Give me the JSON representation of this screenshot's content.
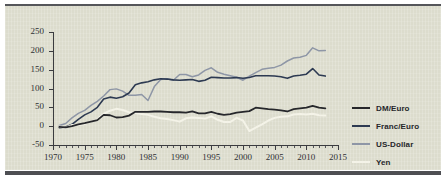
{
  "chart_data": {
    "type": "line",
    "title": "",
    "subtitle": "",
    "xlabel": "",
    "ylabel": "",
    "xlim": [
      1970,
      2015
    ],
    "ylim": [
      -50,
      250
    ],
    "grid": false,
    "legend_position": "right",
    "y_ticks": [
      250,
      200,
      150,
      100,
      50,
      0,
      -50
    ],
    "y_tick_labels": [
      "250",
      "200",
      "150",
      "100",
      "50",
      "0",
      "-50"
    ],
    "x_ticks": [
      1970,
      1975,
      1980,
      1985,
      1990,
      1995,
      2000,
      2005,
      2010,
      2015
    ],
    "x_tick_labels": [
      "1970",
      "1975",
      "1980",
      "1985",
      "1990",
      "1995",
      "2000",
      "2005",
      "2010",
      "2015"
    ],
    "x_minor_tick_step": 1,
    "x": [
      1971,
      1972,
      1973,
      1974,
      1975,
      1976,
      1977,
      1978,
      1979,
      1980,
      1981,
      1982,
      1983,
      1984,
      1985,
      1986,
      1987,
      1988,
      1989,
      1990,
      1991,
      1992,
      1993,
      1994,
      1995,
      1996,
      1997,
      1998,
      1999,
      2000,
      2001,
      2002,
      2003,
      2004,
      2005,
      2006,
      2007,
      2008,
      2009,
      2010,
      2011,
      2012,
      2013
    ],
    "series": [
      {
        "name": "DM/Euro",
        "color": "#26272b",
        "values": [
          -2,
          -3,
          0,
          5,
          8,
          12,
          16,
          30,
          29,
          23,
          24,
          28,
          38,
          38,
          38,
          39,
          39,
          38,
          37,
          37,
          36,
          39,
          34,
          34,
          38,
          33,
          30,
          32,
          36,
          38,
          40,
          49,
          47,
          45,
          44,
          42,
          39,
          45,
          47,
          49,
          54,
          49,
          47
        ]
      },
      {
        "name": "Franc/Euro",
        "color": "#2d3a52",
        "values": [
          -4,
          -2,
          5,
          18,
          30,
          38,
          50,
          72,
          77,
          74,
          78,
          88,
          110,
          115,
          118,
          123,
          126,
          125,
          123,
          122,
          123,
          124,
          119,
          122,
          130,
          129,
          128,
          128,
          129,
          127,
          129,
          134,
          134,
          134,
          133,
          131,
          127,
          133,
          135,
          138,
          153,
          136,
          133
        ]
      },
      {
        "name": "US-Dollar",
        "color": "#8e96a6",
        "values": [
          2,
          7,
          22,
          34,
          42,
          55,
          66,
          80,
          97,
          99,
          93,
          82,
          82,
          84,
          68,
          105,
          124,
          126,
          122,
          137,
          137,
          131,
          136,
          148,
          155,
          143,
          138,
          134,
          130,
          122,
          133,
          142,
          151,
          154,
          156,
          162,
          173,
          181,
          183,
          188,
          208,
          200,
          201
        ]
      },
      {
        "name": "Yen",
        "color": "#f4f3e8",
        "values": [
          -1,
          -4,
          3,
          3,
          6,
          12,
          18,
          33,
          41,
          46,
          43,
          37,
          35,
          32,
          30,
          25,
          21,
          19,
          16,
          12,
          21,
          23,
          22,
          20,
          26,
          17,
          11,
          11,
          22,
          15,
          -13,
          -4,
          5,
          15,
          22,
          25,
          26,
          31,
          32,
          31,
          33,
          29,
          28
        ]
      }
    ]
  },
  "legend": {
    "items": [
      {
        "label": "DM/Euro",
        "color": "#26272b"
      },
      {
        "label": "Franc/Euro",
        "color": "#2d3a52"
      },
      {
        "label": "US-Dollar",
        "color": "#8e96a6"
      },
      {
        "label": "Yen",
        "color": "#f4f3e8"
      }
    ]
  },
  "colors": {
    "panel_background": "#dcdccd",
    "page_background": "#ffffff",
    "axis": "#3b3c40",
    "rule": "#55565a"
  }
}
